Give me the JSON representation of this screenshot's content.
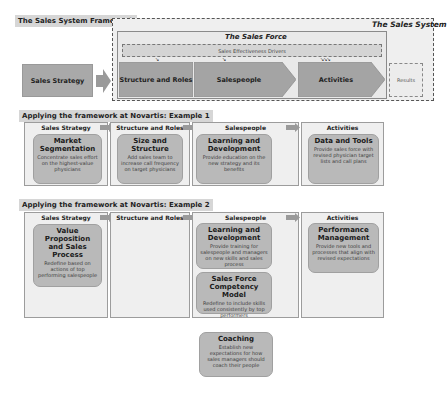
{
  "framework": {
    "title": "The Sales System Framework",
    "system_title": "The Sales System",
    "salesforce_title": "The Sales Force",
    "drivers_label": "Sales Effectiveness Drivers",
    "strategy_label": "Sales Strategy",
    "chevrons": [
      {
        "label": "Structure and Roles"
      },
      {
        "label": "Salespeople"
      },
      {
        "label": "Activities"
      }
    ],
    "results_label": "Results"
  },
  "example1": {
    "title": "Applying the framework at Novartis: Example 1",
    "columns": [
      {
        "header": "Sales Strategy",
        "cards": [
          {
            "title": "Market Segmentation",
            "desc": "Concentrate sales effort on the highest-value physicians"
          }
        ]
      },
      {
        "header": "Structure and Roles",
        "cards": [
          {
            "title": "Size and Structure",
            "desc": "Add sales team to increase call frequency on target physicians"
          }
        ]
      },
      {
        "header": "Salespeople",
        "cards": [
          {
            "title": "Learning and Development",
            "desc": "Provide education on the new strategy and its benefits"
          }
        ]
      },
      {
        "header": "Activities",
        "cards": [
          {
            "title": "Data and Tools",
            "desc": "Provide sales force with revised physician target lists and call plans"
          }
        ]
      }
    ]
  },
  "example2": {
    "title": "Applying the framework at Novartis: Example 2",
    "columns": [
      {
        "header": "Sales Strategy",
        "cards": [
          {
            "title": "Value Proposition and Sales Process",
            "desc": "Redefine based on actions of top performing salespeople"
          }
        ]
      },
      {
        "header": "Structure and Roles",
        "cards": []
      },
      {
        "header": "Salespeople",
        "cards": [
          {
            "title": "Learning and Development",
            "desc": "Provide training for salespeople and managers on new skills and sales process"
          },
          {
            "title": "Sales Force Competency Model",
            "desc": "Redefine to include skills used consistently by top performers"
          },
          {
            "title": "Coaching",
            "desc": "Establish new expectations for how sales managers should coach their people"
          }
        ]
      },
      {
        "header": "Activities",
        "cards": [
          {
            "title": "Performance Management",
            "desc": "Provide new tools and processes that align with revised expectations"
          }
        ]
      }
    ]
  },
  "colors": {
    "chevron": "#a4a4a4",
    "card": "#b9b9b9",
    "column_bg": "#efefef",
    "label_bg": "#d6d6d6"
  }
}
